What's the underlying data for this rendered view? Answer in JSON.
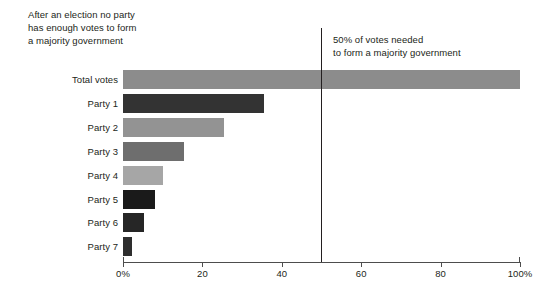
{
  "caption": {
    "lines": [
      "After an election no party",
      "has enough votes to form",
      "a majority government"
    ]
  },
  "annotation": {
    "lines": [
      "50% of votes needed",
      "to form a majority government"
    ],
    "value": 50
  },
  "chart_data": {
    "type": "bar",
    "orientation": "horizontal",
    "title": "After an election no party has enough votes to form a majority government",
    "xlabel": "",
    "ylabel": "",
    "xlim": [
      0,
      100
    ],
    "grid": false,
    "legend": null,
    "categories": [
      "Total votes",
      "Party 1",
      "Party 2",
      "Party 3",
      "Party 4",
      "Party 5",
      "Party 6",
      "Party 7"
    ],
    "values": [
      100,
      35.6,
      25.5,
      15.4,
      10.1,
      8.0,
      5.3,
      2.3
    ],
    "bar_colors": [
      "#8c8c8c",
      "#333333",
      "#939393",
      "#6e6e6e",
      "#a6a6a6",
      "#1a1a1a",
      "#262626",
      "#2e2e2e"
    ],
    "xticks": [
      0,
      20,
      40,
      60,
      80,
      100
    ],
    "xticklabels": [
      "0%",
      "20",
      "40",
      "60",
      "80",
      "100%"
    ],
    "annotations": [
      {
        "type": "vline",
        "x": 50,
        "label": "50% of votes needed to form a majority government",
        "color": "#231f20"
      }
    ]
  }
}
